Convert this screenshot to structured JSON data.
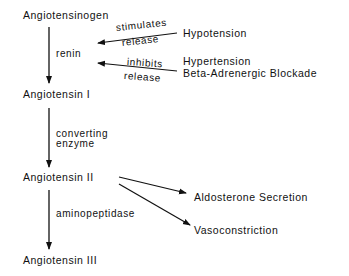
{
  "diagram": {
    "nodes": [
      {
        "id": "angiotensinogen",
        "label": "Angiotensinogen"
      },
      {
        "id": "angiotensin-1",
        "label": "Angiotensin I"
      },
      {
        "id": "angiotensin-2",
        "label": "Angiotensin II"
      },
      {
        "id": "angiotensin-3",
        "label": "Angiotensin III"
      }
    ],
    "enzymes": [
      {
        "label": "renin"
      },
      {
        "label_line1": "converting",
        "label_line2": "enzyme"
      },
      {
        "label": "aminopeptidase"
      }
    ],
    "regulators": {
      "stimulate": {
        "verb": "stimulates",
        "object": "release",
        "source": "Hypotension"
      },
      "inhibit": {
        "verb": "inhibits",
        "object": "release",
        "source_line1": "Hypertension",
        "source_line2": "Beta-Adrenergic Blockade"
      }
    },
    "effects": [
      {
        "label": "Aldosterone Secretion"
      },
      {
        "label": "Vasoconstriction"
      }
    ]
  }
}
